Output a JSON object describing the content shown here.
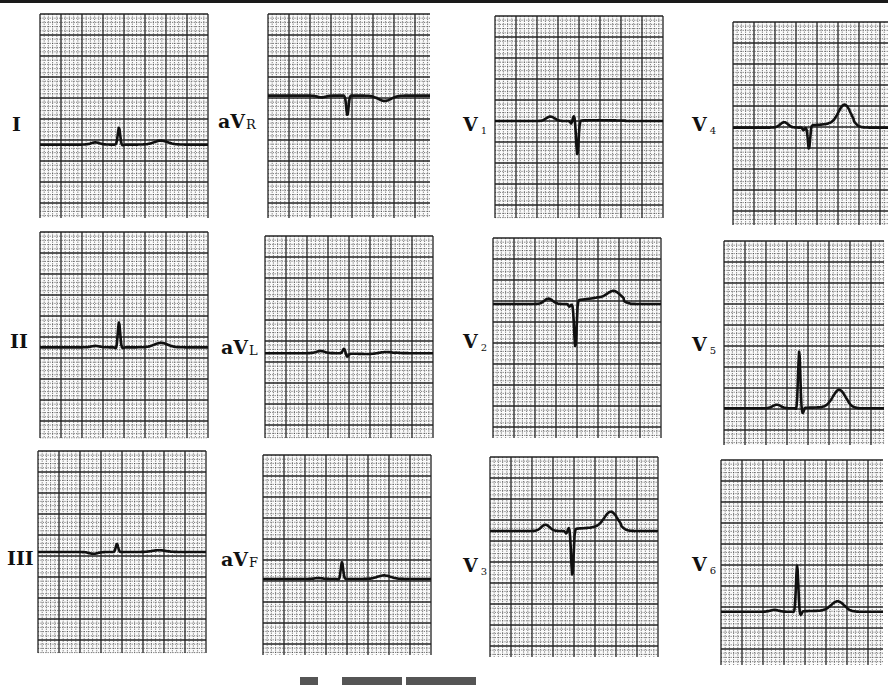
{
  "figure": {
    "caption_visible": false,
    "grid_color": "#222222",
    "trace_color": "#111111",
    "paper_color": "#ffffff"
  },
  "leads": [
    {
      "id": "I",
      "main": "I",
      "sub": "",
      "wave": {
        "p": 0.12,
        "q": 0.0,
        "r": 0.95,
        "s": -0.05,
        "t": 0.22,
        "st": 0.0,
        "pre": 0.0
      }
    },
    {
      "id": "aVR",
      "main": "aV",
      "sub": "R",
      "wave": {
        "p": -0.1,
        "q": 0.0,
        "r": 0.0,
        "s": -1.1,
        "t": -0.3,
        "st": 0.0,
        "pre": 0.0
      }
    },
    {
      "id": "V1",
      "main": "V",
      "sub": "1",
      "wave": {
        "p": 0.25,
        "q": -0.15,
        "r": 0.3,
        "s": -1.9,
        "t": 0.0,
        "st": 0.05,
        "pre": 0.0
      }
    },
    {
      "id": "V4",
      "main": "V",
      "sub": "4",
      "wave": {
        "p": 0.3,
        "q": -0.15,
        "r": 0.0,
        "s": -1.2,
        "t": 1.15,
        "st": 0.2,
        "pre": 0.0
      }
    },
    {
      "id": "II",
      "main": "II",
      "sub": "",
      "wave": {
        "p": 0.08,
        "q": -0.1,
        "r": 1.4,
        "s": -0.05,
        "t": 0.25,
        "st": 0.0,
        "pre": 0.0
      }
    },
    {
      "id": "aVL",
      "main": "aV",
      "sub": "L",
      "wave": {
        "p": 0.12,
        "q": 0.0,
        "r": 0.25,
        "s": -0.2,
        "t": 0.1,
        "st": -0.05,
        "pre": 0.0
      }
    },
    {
      "id": "V2",
      "main": "V",
      "sub": "2",
      "wave": {
        "p": 0.3,
        "q": -0.15,
        "r": 0.0,
        "s": -2.4,
        "t": 0.5,
        "st": 0.35,
        "pre": 0.0
      }
    },
    {
      "id": "V5",
      "main": "V",
      "sub": "5",
      "wave": {
        "p": 0.2,
        "q": -0.1,
        "r": 3.2,
        "s": -0.3,
        "t": 1.0,
        "st": 0.05,
        "pre": 0.0
      }
    },
    {
      "id": "III",
      "main": "III",
      "sub": "",
      "wave": {
        "p": -0.1,
        "q": 0.0,
        "r": 0.45,
        "s": 0.0,
        "t": 0.1,
        "st": 0.0,
        "pre": 0.0
      }
    },
    {
      "id": "aVF",
      "main": "aV",
      "sub": "F",
      "wave": {
        "p": 0.05,
        "q": -0.05,
        "r": 0.95,
        "s": 0.0,
        "t": 0.2,
        "st": 0.0,
        "pre": 0.0
      }
    },
    {
      "id": "V3",
      "main": "V",
      "sub": "3",
      "wave": {
        "p": 0.35,
        "q": -0.15,
        "r": 0.2,
        "s": -2.5,
        "t": 0.95,
        "st": 0.2,
        "pre": 0.0
      }
    },
    {
      "id": "V6",
      "main": "V",
      "sub": "6",
      "wave": {
        "p": 0.1,
        "q": -0.05,
        "r": 2.6,
        "s": -0.2,
        "t": 0.55,
        "st": 0.05,
        "pre": 0.0
      }
    }
  ]
}
